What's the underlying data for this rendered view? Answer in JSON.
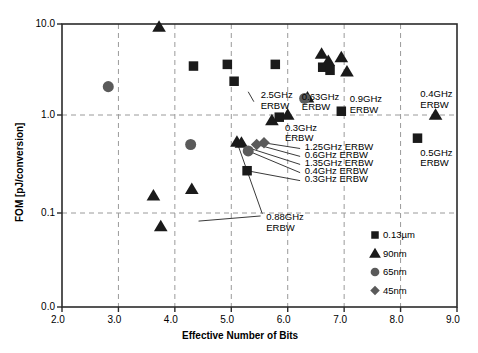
{
  "chart_data": {
    "type": "scatter",
    "title": "",
    "xlabel": "Effective Number of Bits",
    "ylabel": "FOM [pJ/conversion]",
    "xlim": [
      2.0,
      9.0
    ],
    "ylim": [
      0.01,
      10.0
    ],
    "yscale": "log",
    "xticks": [
      "2.0",
      "3.0",
      "4.0",
      "5.0",
      "6.0",
      "7.0",
      "8.0",
      "9.0"
    ],
    "xtick_values": [
      2.0,
      3.0,
      4.0,
      5.0,
      6.0,
      7.0,
      8.0,
      9.0
    ],
    "yticks": [
      "10.0",
      "1.0",
      "0.1",
      "0.0"
    ],
    "ytick_values": [
      10.0,
      1.0,
      0.1,
      0.01
    ],
    "grid": true,
    "grid_style": "dashed",
    "legend_position": "bottom-right",
    "series": [
      {
        "name": "0.13µm",
        "marker": "square",
        "color": "#1a1a1a",
        "points": [
          {
            "x": 4.33,
            "y": 3.45
          },
          {
            "x": 4.93,
            "y": 3.6
          },
          {
            "x": 5.05,
            "y": 2.35
          },
          {
            "x": 5.78,
            "y": 3.6
          },
          {
            "x": 6.62,
            "y": 3.35
          },
          {
            "x": 6.95,
            "y": 1.1
          },
          {
            "x": 6.75,
            "y": 3.1
          },
          {
            "x": 5.85,
            "y": 0.95
          },
          {
            "x": 8.3,
            "y": 0.58
          },
          {
            "x": 5.28,
            "y": 0.27
          }
        ]
      },
      {
        "name": "90nm",
        "marker": "triangle",
        "color": "#1a1a1a",
        "points": [
          {
            "x": 3.72,
            "y": 9.3
          },
          {
            "x": 6.6,
            "y": 4.7
          },
          {
            "x": 6.72,
            "y": 3.9
          },
          {
            "x": 6.95,
            "y": 4.3
          },
          {
            "x": 6.35,
            "y": 1.55
          },
          {
            "x": 7.05,
            "y": 3.0
          },
          {
            "x": 5.72,
            "y": 0.88
          },
          {
            "x": 6.0,
            "y": 1.0
          },
          {
            "x": 8.62,
            "y": 1.0
          },
          {
            "x": 5.18,
            "y": 0.52
          },
          {
            "x": 3.62,
            "y": 0.15
          },
          {
            "x": 4.3,
            "y": 0.175
          },
          {
            "x": 3.75,
            "y": 0.072
          },
          {
            "x": 5.1,
            "y": 0.53
          }
        ]
      },
      {
        "name": "65nm",
        "marker": "circle",
        "color": "#5a5a5a",
        "points": [
          {
            "x": 2.82,
            "y": 2.05
          },
          {
            "x": 6.3,
            "y": 1.52
          },
          {
            "x": 4.28,
            "y": 0.5
          },
          {
            "x": 5.3,
            "y": 0.43
          }
        ]
      },
      {
        "name": "45nm",
        "marker": "diamond",
        "color": "#5a5a5a",
        "points": [
          {
            "x": 5.45,
            "y": 0.5
          },
          {
            "x": 5.58,
            "y": 0.52
          }
        ]
      }
    ],
    "annotations": [
      {
        "id": "ann-2-5ghz",
        "text": "2.5GHz\nERBW",
        "x": 5.52,
        "y": 1.6
      },
      {
        "id": "ann-0-63ghz",
        "text": "0.63GHz\nERBW",
        "x": 6.25,
        "y": 1.55
      },
      {
        "id": "ann-0-9ghz",
        "text": "0.9GHz\nERBW",
        "x": 7.1,
        "y": 1.45
      },
      {
        "id": "ann-0-4ghz",
        "text": "0.4GHz\nERBW",
        "x": 8.35,
        "y": 1.65
      },
      {
        "id": "ann-0-3ghz",
        "text": "0.3GHz\nERBW",
        "x": 5.95,
        "y": 0.72
      },
      {
        "id": "ann-0-5ghz",
        "text": "0.5GHz\nERBW",
        "x": 8.35,
        "y": 0.4
      },
      {
        "id": "ann-1-25ghz",
        "text": "1.25GHz ERBW",
        "x": 6.3,
        "y": 0.46
      },
      {
        "id": "ann-0-6ghz",
        "text": "0.6GHz ERBW",
        "x": 6.3,
        "y": 0.38
      },
      {
        "id": "ann-1-35ghz",
        "text": "1.35GHz ERBW",
        "x": 6.3,
        "y": 0.315
      },
      {
        "id": "ann-0-4ghz-b",
        "text": "0.4GHz ERBW",
        "x": 6.3,
        "y": 0.26
      },
      {
        "id": "ann-0-3ghz-b",
        "text": "0.3GHz ERBW",
        "x": 6.3,
        "y": 0.215
      },
      {
        "id": "ann-0-88ghz",
        "text": "0.88GHz\nERBW",
        "x": 5.62,
        "y": 0.088
      }
    ]
  },
  "legend": {
    "items": [
      {
        "label": "0.13µm",
        "marker": "square"
      },
      {
        "label": "90nm",
        "marker": "triangle"
      },
      {
        "label": "65nm",
        "marker": "circle"
      },
      {
        "label": "45nm",
        "marker": "diamond"
      }
    ]
  },
  "axes": {
    "x_title": "Effective Number of Bits",
    "y_title": "FOM [pJ/conversion]"
  }
}
